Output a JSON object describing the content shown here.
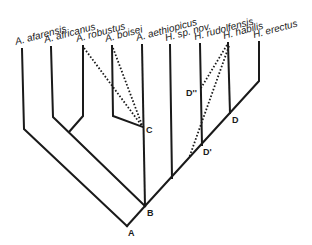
{
  "diagram": {
    "type": "cladogram",
    "taxa": [
      {
        "label": "A.  afarensis",
        "x": 22,
        "top": 49
      },
      {
        "label": "A.  africanus",
        "x": 51,
        "top": 47
      },
      {
        "label": "A.  robustus",
        "x": 83,
        "top": 46
      },
      {
        "label": "A.  boisei",
        "x": 112,
        "top": 46
      },
      {
        "label": "A.  aethiopicus",
        "x": 142,
        "top": 45
      },
      {
        "label": "H. sp. nov.",
        "x": 171,
        "top": 45
      },
      {
        "label": "H.  rudolfensis",
        "x": 201,
        "top": 44
      },
      {
        "label": "H.  habilis",
        "x": 228,
        "top": 43
      },
      {
        "label": "H.  erectus",
        "x": 259,
        "top": 42
      }
    ],
    "nodes": [
      {
        "label": "A"
      },
      {
        "label": "B"
      },
      {
        "label": "C"
      },
      {
        "label": "D"
      },
      {
        "label": "D'"
      },
      {
        "label": "D''"
      }
    ]
  }
}
